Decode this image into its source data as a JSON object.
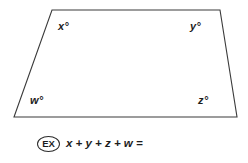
{
  "figure": {
    "name": "quadrilateral-angle-diagram",
    "shape": "quadrilateral",
    "stroke_color": "#3a3a3a",
    "fill_color": "#ffffff",
    "vertices": [
      {
        "name": "top-left",
        "x": 52,
        "y": 10
      },
      {
        "name": "top-right",
        "x": 220,
        "y": 10
      },
      {
        "name": "bottom-right",
        "x": 237,
        "y": 117
      },
      {
        "name": "bottom-left",
        "x": 14,
        "y": 117
      }
    ],
    "angle_labels": {
      "top_left": "x°",
      "top_right": "y°",
      "bottom_left": "w°",
      "bottom_right": "z°"
    }
  },
  "prompt": {
    "badge_label": "EX",
    "equation": "x + y + z + w ="
  }
}
